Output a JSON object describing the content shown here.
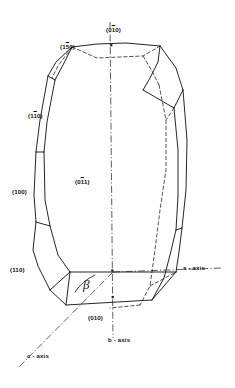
{
  "figure": {
    "kind": "crystal-morphology-diagram",
    "system": "monoclinic",
    "background_color": "#ffffff",
    "line_color": "#1a1a1a"
  },
  "face_labels": [
    {
      "name": "face-label-010-top",
      "pre": "(0",
      "bar": "1",
      "post": "0)",
      "x": 106,
      "y": 27
    },
    {
      "name": "face-label-150",
      "pre": "(1",
      "bar": "5",
      "post": "0)",
      "x": 60,
      "y": 44
    },
    {
      "name": "face-label-110-upper",
      "pre": "(1",
      "bar": "1",
      "post": "0)",
      "x": 28,
      "y": 113
    },
    {
      "name": "face-label-100",
      "pre": "(100)",
      "bar": "",
      "post": "",
      "x": 12,
      "y": 189
    },
    {
      "name": "face-label-011",
      "pre": "(0",
      "bar": "1",
      "post": "1)",
      "x": 75,
      "y": 179
    },
    {
      "name": "face-label-110-lower",
      "pre": "(110)",
      "bar": "",
      "post": "",
      "x": 10,
      "y": 267
    },
    {
      "name": "face-label-010-bottom",
      "pre": "(010)",
      "bar": "",
      "post": "",
      "x": 88,
      "y": 315
    }
  ],
  "axis_labels": [
    {
      "name": "axis-label-a",
      "text": "a - axis",
      "x": 183,
      "y": 265
    },
    {
      "name": "axis-label-b",
      "text": "b - axis",
      "x": 108,
      "y": 337
    },
    {
      "name": "axis-label-c",
      "text": "c - axis",
      "x": 27,
      "y": 353
    }
  ],
  "angle": {
    "name": "beta-angle-label",
    "symbol": "β",
    "x": 83,
    "y": 277
  }
}
